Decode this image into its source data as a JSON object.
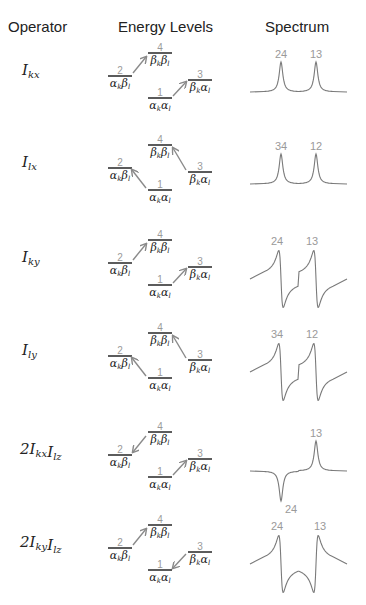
{
  "headers": {
    "operator": "Operator",
    "energy_levels": "Energy Levels",
    "spectrum": "Spectrum"
  },
  "levels": {
    "1": {
      "number": "1",
      "state": "αkαl"
    },
    "2": {
      "number": "2",
      "state": "αkβl"
    },
    "3": {
      "number": "3",
      "state": "βkαl"
    },
    "4": {
      "number": "4",
      "state": "βkβl"
    }
  },
  "rows": [
    {
      "operator": {
        "prefix": "",
        "parts": [
          {
            "base": "I",
            "sub": "kx"
          }
        ]
      },
      "arrows": [
        {
          "from": 2,
          "to": 4
        },
        {
          "from": 1,
          "to": 3
        }
      ],
      "spectrum": {
        "lineshape": "absorptive",
        "peaks": [
          {
            "label": "24",
            "sign": "+",
            "shape": "absorptive"
          },
          {
            "label": "13",
            "sign": "+",
            "shape": "absorptive"
          }
        ]
      }
    },
    {
      "operator": {
        "prefix": "",
        "parts": [
          {
            "base": "I",
            "sub": "lx"
          }
        ]
      },
      "arrows": [
        {
          "from": 1,
          "to": 2
        },
        {
          "from": 3,
          "to": 4
        }
      ],
      "spectrum": {
        "lineshape": "absorptive",
        "peaks": [
          {
            "label": "34",
            "sign": "+",
            "shape": "absorptive"
          },
          {
            "label": "12",
            "sign": "+",
            "shape": "absorptive"
          }
        ]
      }
    },
    {
      "operator": {
        "prefix": "",
        "parts": [
          {
            "base": "I",
            "sub": "ky"
          }
        ]
      },
      "arrows": [
        {
          "from": 2,
          "to": 4
        },
        {
          "from": 1,
          "to": 3
        }
      ],
      "spectrum": {
        "lineshape": "dispersive",
        "peaks": [
          {
            "label": "24",
            "sign": "+",
            "shape": "dispersive"
          },
          {
            "label": "13",
            "sign": "+",
            "shape": "dispersive"
          }
        ]
      }
    },
    {
      "operator": {
        "prefix": "",
        "parts": [
          {
            "base": "I",
            "sub": "ly"
          }
        ]
      },
      "arrows": [
        {
          "from": 1,
          "to": 2
        },
        {
          "from": 3,
          "to": 4
        }
      ],
      "spectrum": {
        "lineshape": "dispersive",
        "peaks": [
          {
            "label": "34",
            "sign": "+",
            "shape": "dispersive"
          },
          {
            "label": "12",
            "sign": "+",
            "shape": "dispersive"
          }
        ]
      }
    },
    {
      "operator": {
        "prefix": "2",
        "parts": [
          {
            "base": "I",
            "sub": "kx"
          },
          {
            "base": "I",
            "sub": "lz"
          }
        ]
      },
      "arrows": [
        {
          "from": 4,
          "to": 2
        },
        {
          "from": 1,
          "to": 3
        }
      ],
      "spectrum": {
        "lineshape": "absorptive antiphase",
        "peaks": [
          {
            "label": "24",
            "sign": "-",
            "shape": "absorptive"
          },
          {
            "label": "13",
            "sign": "+",
            "shape": "absorptive"
          }
        ]
      }
    },
    {
      "operator": {
        "prefix": "2",
        "parts": [
          {
            "base": "I",
            "sub": "ky"
          },
          {
            "base": "I",
            "sub": "lz"
          }
        ]
      },
      "arrows": [
        {
          "from": 2,
          "to": 4
        },
        {
          "from": 3,
          "to": 1
        }
      ],
      "spectrum": {
        "lineshape": "dispersive antiphase",
        "peaks": [
          {
            "label": "24",
            "sign": "+",
            "shape": "dispersive"
          },
          {
            "label": "13",
            "sign": "-",
            "shape": "dispersive"
          }
        ]
      }
    }
  ],
  "colors": {
    "text": "#222222",
    "level_number": "#9a9a9a",
    "arrow": "#8a8a8a",
    "level_line": "#333333",
    "spectrum_line": "#7a7a7a",
    "peak_label": "#9a9a9a"
  }
}
